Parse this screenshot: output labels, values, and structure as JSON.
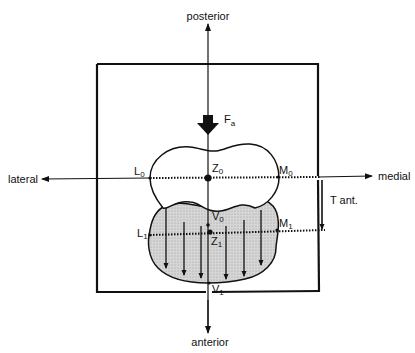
{
  "diagram": {
    "axes": {
      "top": "posterior",
      "bottom": "anterior",
      "left": "lateral",
      "right": "medial"
    },
    "force": {
      "label": "F",
      "subscript": "a"
    },
    "translation": {
      "label": "T ant."
    },
    "points": {
      "L0": {
        "label": "L",
        "subscript": "0"
      },
      "Z0": {
        "label": "Z",
        "subscript": "0"
      },
      "M0": {
        "label": "M",
        "subscript": "0"
      },
      "V0": {
        "label": "V",
        "subscript": "0"
      },
      "L1": {
        "label": "L",
        "subscript": "1"
      },
      "Z1": {
        "label": "Z",
        "subscript": "1"
      },
      "M1": {
        "label": "M",
        "subscript": "1"
      },
      "V1": {
        "label": "V",
        "subscript": "1"
      }
    },
    "colors": {
      "line": "#111111",
      "shaded_fill": "#d0d0d0",
      "background": "#ffffff"
    }
  }
}
